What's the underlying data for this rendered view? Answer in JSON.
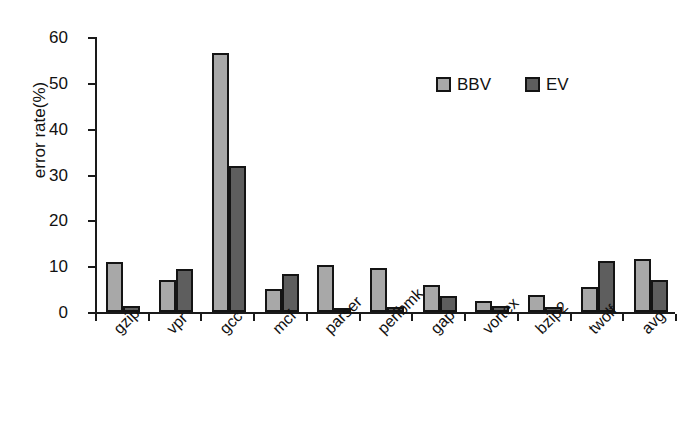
{
  "chart_data": {
    "type": "bar",
    "title": "",
    "xlabel": "",
    "ylabel": "error rate(%)",
    "ylim": [
      0,
      60
    ],
    "yticks": [
      0,
      10,
      20,
      30,
      40,
      50,
      60
    ],
    "grid": false,
    "legend_position": "top-right",
    "categories": [
      "gzip",
      "vpr",
      "gcc",
      "mcf",
      "parser",
      "perlbmk",
      "gap",
      "vortex",
      "bzip2",
      "twolf",
      "avg"
    ],
    "series": [
      {
        "name": "BBV",
        "color": "#a8a8a8",
        "values": [
          11.0,
          7.0,
          56.5,
          5.0,
          10.3,
          9.7,
          5.8,
          2.4,
          3.8,
          5.5,
          11.5
        ]
      },
      {
        "name": "EV",
        "color": "#5e5e5e",
        "values": [
          1.3,
          9.4,
          31.8,
          8.2,
          0.3,
          1.0,
          3.5,
          1.4,
          1.0,
          11.1,
          7.0
        ]
      }
    ]
  },
  "axis": {
    "y_title": "error rate(%)",
    "y_tick_labels": [
      "0",
      "10",
      "20",
      "30",
      "40",
      "50",
      "60"
    ]
  },
  "legend": {
    "items": [
      {
        "label": "BBV",
        "color": "#a8a8a8"
      },
      {
        "label": "EV",
        "color": "#5e5e5e"
      }
    ]
  }
}
